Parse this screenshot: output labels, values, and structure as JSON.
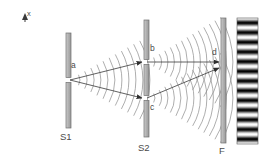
{
  "figure": {
    "background_color": "#ffffff",
    "width": 267,
    "height": 165
  },
  "axis": {
    "label": "x",
    "arrow_direction": "up",
    "icon": "up-arrow-icon"
  },
  "labels": {
    "source_slit": "a",
    "upper_slit": "b",
    "lower_slit": "c",
    "screen_point": "d",
    "barrier_one": "S1",
    "barrier_two": "S2",
    "screen": "F"
  },
  "elements": {
    "barrier_s1": {
      "name": "S1",
      "x": 66,
      "top": 33,
      "bottom": 128,
      "width": 5,
      "fill": "#b0b0b0",
      "stroke": "#6e6e6e",
      "slit_center_y": 80,
      "slit_height": 5
    },
    "barrier_s2": {
      "name": "S2",
      "x": 144,
      "top": 20,
      "bottom": 137,
      "width": 5,
      "fill": "#b0b0b0",
      "stroke": "#6e6e6e",
      "slit_a_center_y": 62,
      "slit_b_center_y": 98,
      "slit_height": 5
    },
    "screen_f": {
      "name": "F",
      "x": 221,
      "top": 18,
      "bottom": 143,
      "width": 5,
      "fill": "#b8b8b8",
      "stroke": "#707070"
    },
    "fringe_pattern": {
      "name": "interference-fringes",
      "x": 237,
      "top": 18,
      "width": 21,
      "height": 126,
      "orientation": "horizontal-bands",
      "band_count": 13,
      "light_color": "#ffffff",
      "dark_color": "#111111"
    }
  },
  "rays": [
    {
      "from": "a",
      "to": "b",
      "x1": 70,
      "y1": 80,
      "x2": 142,
      "y2": 62
    },
    {
      "from": "a",
      "to": "c",
      "x1": 70,
      "y1": 80,
      "x2": 142,
      "y2": 98
    },
    {
      "from": "b",
      "to": "d",
      "x1": 147,
      "y1": 62,
      "x2": 219,
      "y2": 62
    },
    {
      "from": "c",
      "to": "d",
      "x1": 147,
      "y1": 98,
      "x2": 219,
      "y2": 68
    }
  ],
  "wavefronts": {
    "source_a": {
      "origin_x": 70,
      "origin_y": 80,
      "count": 11,
      "spacing": 7,
      "start_radius": 10,
      "spread_deg": 58,
      "color": "#8a8a8a"
    },
    "source_b": {
      "origin_x": 147,
      "origin_y": 62,
      "count": 13,
      "spacing": 6.5,
      "start_radius": 8,
      "spread_deg": 62,
      "color": "#8a8a8a"
    },
    "source_c": {
      "origin_x": 147,
      "origin_y": 98,
      "count": 13,
      "spacing": 6.5,
      "start_radius": 8,
      "spread_deg": 62,
      "color": "#8a8a8a"
    }
  },
  "colors": {
    "ink": "#4a4a4a",
    "bar_fill": "#b0b0b0",
    "bar_stroke": "#6e6e6e",
    "wave_stroke": "#8a8a8a",
    "ray_stroke": "#3a3a3a"
  }
}
